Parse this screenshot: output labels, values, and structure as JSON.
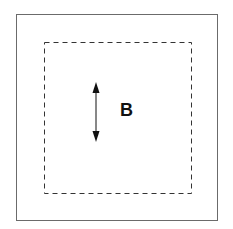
{
  "diagram": {
    "label": "B",
    "elements": {
      "outer_box": "solid square border",
      "inner_box": "dashed square",
      "arrow": "vertical double-headed arrow"
    },
    "colors": {
      "outer_border": "#6b6b6b",
      "dashed": "#333333",
      "arrow": "#111111"
    }
  }
}
